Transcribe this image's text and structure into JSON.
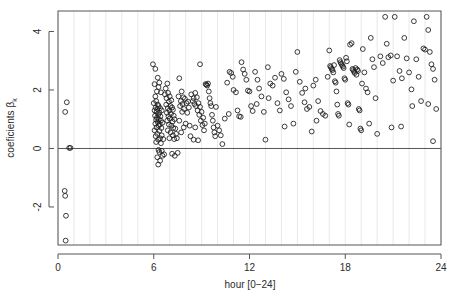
{
  "chart_data": {
    "type": "scatter",
    "title": "",
    "subtitle": "",
    "xlabel": "hour [0−24]",
    "ylabel": "coeficients βk",
    "ylabel_base": "coeficients β",
    "ylabel_sub": "k",
    "xlim": [
      0,
      24
    ],
    "ylim": [
      -3.3,
      4.7
    ],
    "xticks": [
      0,
      6,
      12,
      18,
      24
    ],
    "xtick_labels": [
      "0",
      "6",
      "12",
      "18",
      "24"
    ],
    "yticks": [
      -2,
      0,
      2,
      4
    ],
    "ytick_labels": [
      "-2",
      "0",
      "2",
      "4"
    ],
    "grid": "vertical gridlines every 1 hour",
    "gridline_interval": 1,
    "gridline_color": "#e8e8ee",
    "reference_line": {
      "axis": "horizontal",
      "value": 0,
      "color": "#555555"
    },
    "marker": {
      "shape": "open-circle",
      "radius": 2.4,
      "color": "#1a1a1a",
      "fill": "none"
    },
    "legend": "none",
    "frame_color": "#555555",
    "n_points": 292,
    "points": [
      [
        0.45,
        1.25
      ],
      [
        0.55,
        1.58
      ],
      [
        0.7,
        0.02
      ],
      [
        0.78,
        0.02
      ],
      [
        0.42,
        -1.45
      ],
      [
        0.45,
        -1.62
      ],
      [
        0.5,
        -2.3
      ],
      [
        0.48,
        -3.15
      ],
      [
        5.95,
        2.88
      ],
      [
        6.1,
        2.72
      ],
      [
        6.25,
        2.42
      ],
      [
        6.05,
        2.2
      ],
      [
        6.35,
        2.25
      ],
      [
        6.3,
        2.1
      ],
      [
        6.2,
        1.95
      ],
      [
        6.45,
        1.92
      ],
      [
        6.1,
        1.78
      ],
      [
        6.15,
        1.62
      ],
      [
        6.0,
        1.55
      ],
      [
        6.25,
        1.5
      ],
      [
        6.3,
        1.45
      ],
      [
        6.12,
        1.4
      ],
      [
        6.22,
        1.35
      ],
      [
        6.4,
        1.38
      ],
      [
        6.05,
        1.3
      ],
      [
        6.18,
        1.25
      ],
      [
        6.35,
        1.22
      ],
      [
        6.5,
        1.3
      ],
      [
        6.28,
        1.15
      ],
      [
        6.08,
        1.12
      ],
      [
        6.42,
        1.1
      ],
      [
        6.2,
        1.05
      ],
      [
        6.32,
        1.0
      ],
      [
        6.15,
        0.98
      ],
      [
        6.45,
        0.95
      ],
      [
        6.25,
        0.9
      ],
      [
        6.1,
        0.85
      ],
      [
        6.38,
        0.82
      ],
      [
        6.55,
        0.88
      ],
      [
        6.3,
        0.78
      ],
      [
        6.18,
        0.72
      ],
      [
        6.48,
        0.7
      ],
      [
        6.05,
        0.62
      ],
      [
        6.35,
        0.6
      ],
      [
        6.22,
        0.5
      ],
      [
        6.5,
        0.45
      ],
      [
        6.12,
        0.42
      ],
      [
        6.4,
        0.35
      ],
      [
        6.28,
        0.3
      ],
      [
        6.6,
        0.32
      ],
      [
        6.15,
        0.22
      ],
      [
        6.45,
        0.18
      ],
      [
        6.3,
        -0.05
      ],
      [
        6.5,
        -0.08
      ],
      [
        6.35,
        -0.12
      ],
      [
        6.22,
        -0.3
      ],
      [
        6.55,
        -0.25
      ],
      [
        6.4,
        -0.42
      ],
      [
        6.28,
        -0.55
      ],
      [
        6.65,
        -0.2
      ],
      [
        6.75,
        2.05
      ],
      [
        6.85,
        2.22
      ],
      [
        6.7,
        1.85
      ],
      [
        6.9,
        1.9
      ],
      [
        6.8,
        1.72
      ],
      [
        7.0,
        1.78
      ],
      [
        6.95,
        1.6
      ],
      [
        7.1,
        1.65
      ],
      [
        6.78,
        1.5
      ],
      [
        7.05,
        1.45
      ],
      [
        6.88,
        1.38
      ],
      [
        7.15,
        1.4
      ],
      [
        6.98,
        1.3
      ],
      [
        7.2,
        1.32
      ],
      [
        6.82,
        1.22
      ],
      [
        7.08,
        1.18
      ],
      [
        6.92,
        1.1
      ],
      [
        7.25,
        1.12
      ],
      [
        7.0,
        1.02
      ],
      [
        6.85,
        0.95
      ],
      [
        7.18,
        0.92
      ],
      [
        7.3,
        1.0
      ],
      [
        6.95,
        0.82
      ],
      [
        7.1,
        0.78
      ],
      [
        7.22,
        0.7
      ],
      [
        6.88,
        0.62
      ],
      [
        7.35,
        0.68
      ],
      [
        7.05,
        0.55
      ],
      [
        7.2,
        0.45
      ],
      [
        7.4,
        0.5
      ],
      [
        6.98,
        0.35
      ],
      [
        7.28,
        0.32
      ],
      [
        7.45,
        0.35
      ],
      [
        7.15,
        -0.18
      ],
      [
        7.32,
        -0.25
      ],
      [
        7.5,
        -0.15
      ],
      [
        7.6,
        2.4
      ],
      [
        7.75,
        1.95
      ],
      [
        7.55,
        1.78
      ],
      [
        7.85,
        1.75
      ],
      [
        7.7,
        1.62
      ],
      [
        7.95,
        1.7
      ],
      [
        7.8,
        1.52
      ],
      [
        8.05,
        1.55
      ],
      [
        7.65,
        1.45
      ],
      [
        8.15,
        1.6
      ],
      [
        7.9,
        1.35
      ],
      [
        8.2,
        1.4
      ],
      [
        7.78,
        1.25
      ],
      [
        8.1,
        1.22
      ],
      [
        7.6,
        0.95
      ],
      [
        8.0,
        0.85
      ],
      [
        7.88,
        0.72
      ],
      [
        8.25,
        0.78
      ],
      [
        7.72,
        0.55
      ],
      [
        8.3,
        0.42
      ],
      [
        8.35,
        1.85
      ],
      [
        8.5,
        1.72
      ],
      [
        8.45,
        1.62
      ],
      [
        8.6,
        1.9
      ],
      [
        8.55,
        1.52
      ],
      [
        8.7,
        1.75
      ],
      [
        8.65,
        1.45
      ],
      [
        8.8,
        1.55
      ],
      [
        8.75,
        1.3
      ],
      [
        8.9,
        1.42
      ],
      [
        8.85,
        1.15
      ],
      [
        9.0,
        1.25
      ],
      [
        8.95,
        0.95
      ],
      [
        9.1,
        1.05
      ],
      [
        8.6,
        0.72
      ],
      [
        9.05,
        0.8
      ],
      [
        8.5,
        0.3
      ],
      [
        8.78,
        0.28
      ],
      [
        9.15,
        0.62
      ],
      [
        9.2,
        0.85
      ],
      [
        8.9,
        2.88
      ],
      [
        9.25,
        2.2
      ],
      [
        9.3,
        2.18
      ],
      [
        9.35,
        2.15
      ],
      [
        9.4,
        2.22
      ],
      [
        9.45,
        1.95
      ],
      [
        9.5,
        1.72
      ],
      [
        9.55,
        1.55
      ],
      [
        9.6,
        1.45
      ],
      [
        9.65,
        1.15
      ],
      [
        9.7,
        0.95
      ],
      [
        9.75,
        0.72
      ],
      [
        9.8,
        0.55
      ],
      [
        9.85,
        0.42
      ],
      [
        9.9,
        1.42
      ],
      [
        10.0,
        0.78
      ],
      [
        10.1,
        0.62
      ],
      [
        10.2,
        0.45
      ],
      [
        10.3,
        0.15
      ],
      [
        10.45,
        1.02
      ],
      [
        10.6,
        2.25
      ],
      [
        10.75,
        2.62
      ],
      [
        10.85,
        2.58
      ],
      [
        10.95,
        2.45
      ],
      [
        11.0,
        2.0
      ],
      [
        11.15,
        1.92
      ],
      [
        11.25,
        1.3
      ],
      [
        11.35,
        1.1
      ],
      [
        11.5,
        2.95
      ],
      [
        11.6,
        2.7
      ],
      [
        11.7,
        2.55
      ],
      [
        11.8,
        2.35
      ],
      [
        11.9,
        1.98
      ],
      [
        12.0,
        1.95
      ],
      [
        12.1,
        1.45
      ],
      [
        12.2,
        1.28
      ],
      [
        12.35,
        2.62
      ],
      [
        12.5,
        2.35
      ],
      [
        12.6,
        2.05
      ],
      [
        12.75,
        1.78
      ],
      [
        12.9,
        1.25
      ],
      [
        13.0,
        0.3
      ],
      [
        13.15,
        2.78
      ],
      [
        13.3,
        2.22
      ],
      [
        13.45,
        2.15
      ],
      [
        13.6,
        2.42
      ],
      [
        13.75,
        1.55
      ],
      [
        13.9,
        1.3
      ],
      [
        14.0,
        2.55
      ],
      [
        14.15,
        2.38
      ],
      [
        14.3,
        1.92
      ],
      [
        14.45,
        1.68
      ],
      [
        14.6,
        1.45
      ],
      [
        14.75,
        0.85
      ],
      [
        14.9,
        2.62
      ],
      [
        15.0,
        3.3
      ],
      [
        15.15,
        2.28
      ],
      [
        15.3,
        1.9
      ],
      [
        15.45,
        1.58
      ],
      [
        15.6,
        1.35
      ],
      [
        15.75,
        1.42
      ],
      [
        15.9,
        0.58
      ],
      [
        16.0,
        2.15
      ],
      [
        16.15,
        2.35
      ],
      [
        16.3,
        1.62
      ],
      [
        16.45,
        1.28
      ],
      [
        16.6,
        1.18
      ],
      [
        16.75,
        1.12
      ],
      [
        16.9,
        2.45
      ],
      [
        17.0,
        3.35
      ],
      [
        17.05,
        2.82
      ],
      [
        17.1,
        2.78
      ],
      [
        17.15,
        2.72
      ],
      [
        17.2,
        2.68
      ],
      [
        17.25,
        2.6
      ],
      [
        17.3,
        2.85
      ],
      [
        17.35,
        2.3
      ],
      [
        17.4,
        2.25
      ],
      [
        17.45,
        1.95
      ],
      [
        17.5,
        1.5
      ],
      [
        17.55,
        1.18
      ],
      [
        17.6,
        1.12
      ],
      [
        17.65,
        3.02
      ],
      [
        17.7,
        2.95
      ],
      [
        17.75,
        2.9
      ],
      [
        17.8,
        2.85
      ],
      [
        17.85,
        2.8
      ],
      [
        17.9,
        2.75
      ],
      [
        17.95,
        2.4
      ],
      [
        18.0,
        2.35
      ],
      [
        18.05,
        3.1
      ],
      [
        18.1,
        2.98
      ],
      [
        18.15,
        1.55
      ],
      [
        18.2,
        1.5
      ],
      [
        18.25,
        0.82
      ],
      [
        18.3,
        3.55
      ],
      [
        18.4,
        3.6
      ],
      [
        18.45,
        2.72
      ],
      [
        18.5,
        2.68
      ],
      [
        18.55,
        2.62
      ],
      [
        18.6,
        2.58
      ],
      [
        18.65,
        2.75
      ],
      [
        18.7,
        2.52
      ],
      [
        18.75,
        2.7
      ],
      [
        18.8,
        2.65
      ],
      [
        18.85,
        1.35
      ],
      [
        18.9,
        1.3
      ],
      [
        18.95,
        0.68
      ],
      [
        19.0,
        0.62
      ],
      [
        19.1,
        3.4
      ],
      [
        19.2,
        2.6
      ],
      [
        19.3,
        2.05
      ],
      [
        19.4,
        1.92
      ],
      [
        19.5,
        0.85
      ],
      [
        19.6,
        3.78
      ],
      [
        19.7,
        3.05
      ],
      [
        19.8,
        2.78
      ],
      [
        19.9,
        1.72
      ],
      [
        20.0,
        0.5
      ],
      [
        20.2,
        3.15
      ],
      [
        20.35,
        2.92
      ],
      [
        20.5,
        4.5
      ],
      [
        20.6,
        3.58
      ],
      [
        20.7,
        3.12
      ],
      [
        20.85,
        3.18
      ],
      [
        21.0,
        2.32
      ],
      [
        21.1,
        4.5
      ],
      [
        21.25,
        3.15
      ],
      [
        21.4,
        2.65
      ],
      [
        21.55,
        2.4
      ],
      [
        21.7,
        3.78
      ],
      [
        21.85,
        3.08
      ],
      [
        22.0,
        2.6
      ],
      [
        22.15,
        2.02
      ],
      [
        22.3,
        4.35
      ],
      [
        22.45,
        3.05
      ],
      [
        22.6,
        2.45
      ],
      [
        22.75,
        1.62
      ],
      [
        22.9,
        3.42
      ],
      [
        23.0,
        3.38
      ],
      [
        23.1,
        4.5
      ],
      [
        23.2,
        4.05
      ],
      [
        23.3,
        3.3
      ],
      [
        23.4,
        2.88
      ],
      [
        23.5,
        2.72
      ],
      [
        23.6,
        2.35
      ],
      [
        23.7,
        1.35
      ],
      [
        23.5,
        0.25
      ],
      [
        23.2,
        1.52
      ],
      [
        22.2,
        1.45
      ],
      [
        21.5,
        0.75
      ],
      [
        20.9,
        0.72
      ],
      [
        19.05,
        2.22
      ],
      [
        16.2,
        0.95
      ],
      [
        15.5,
        2.05
      ],
      [
        14.2,
        0.75
      ],
      [
        13.2,
        1.72
      ],
      [
        12.45,
        1.52
      ],
      [
        11.45,
        1.08
      ],
      [
        10.7,
        1.18
      ]
    ]
  }
}
